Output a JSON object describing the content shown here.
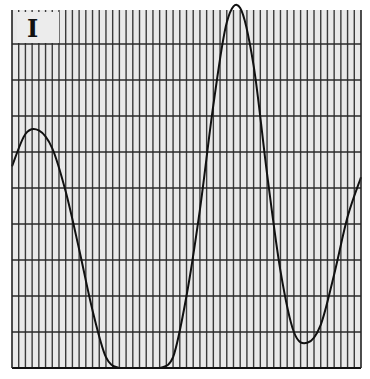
{
  "panel": {
    "label": "I"
  },
  "colors": {
    "background": "#e9e9e9",
    "grid": "#333333",
    "curve": "#111111",
    "page": "#ffffff"
  },
  "chart_data": {
    "type": "line",
    "title": "",
    "panel_label": "I",
    "xlabel": "",
    "ylabel": "",
    "grid": true,
    "grid_vertical_divisions": 52,
    "grid_horizontal_divisions": 10,
    "x": [
      0,
      2,
      4,
      6,
      8,
      10,
      12,
      14,
      16,
      18,
      20,
      22,
      24,
      26,
      28,
      30,
      32,
      34,
      36,
      38,
      40,
      42,
      44,
      46,
      48,
      50,
      52
    ],
    "y": [
      5.6,
      6.5,
      6.6,
      6.1,
      4.9,
      3.3,
      1.6,
      0.3,
      0.0,
      0.0,
      0.0,
      0.0,
      0.3,
      2.0,
      4.4,
      7.3,
      9.6,
      10.0,
      8.4,
      5.4,
      2.7,
      1.0,
      0.7,
      1.2,
      2.6,
      4.2,
      5.3
    ],
    "ylim": [
      0,
      10
    ],
    "xlim": [
      0,
      52
    ]
  }
}
